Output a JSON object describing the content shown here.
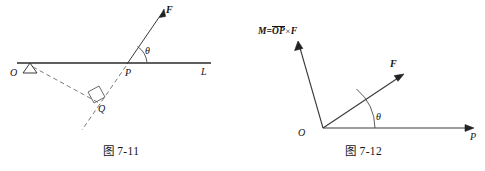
{
  "page": {
    "background_color": "#ffffff",
    "ink_color": "#161616"
  },
  "figures": [
    {
      "id": "fig-7-11",
      "caption": "图 7-11",
      "labels": {
        "origin": "O",
        "line": "L",
        "point_p": "P",
        "point_q": "Q",
        "force": "F",
        "angle": "θ"
      },
      "elements": {
        "line_L": "solid horizontal line through O and P labelled L",
        "pivot": "small triangle support symbol at O",
        "force_vector": "solid arrow from P up-right labelled F",
        "force_line_extension": "dashed extension of force line down-left through Q",
        "segment_OQ": "dashed segment from O to Q",
        "right_angle_marker": "square right-angle marker at Q between OQ and the force line",
        "angle_arc": "arc at P between line L and force F labelled θ"
      }
    },
    {
      "id": "fig-7-12",
      "caption": "图 7-12",
      "labels": {
        "origin": "O",
        "axis_p": "P",
        "force": "F",
        "angle": "θ",
        "moment_prefix": "M=",
        "moment_vector_over": "OP",
        "moment_cross": "×",
        "moment_operand": "F",
        "moment_full": "M=OP×F"
      },
      "elements": {
        "axis_OP": "solid ray from O to the right with arrowhead, labelled P",
        "force_vector": "solid arrow from O up-right labelled F",
        "moment_vector": "solid arrow from O up-left labelled M=OP×F",
        "angle_arc": "arc at O between axis OP and force F labelled θ"
      }
    }
  ]
}
